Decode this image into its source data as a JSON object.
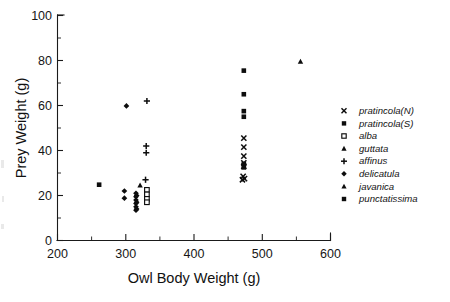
{
  "figure": {
    "background": "#ffffff",
    "ink_color": "#0d0d0d",
    "width": 450,
    "height": 302
  },
  "axes": {
    "x_title": "Owl Body Weight (g)",
    "y_title": "Prey Weight (g)",
    "x_ticks": [
      "200",
      "300",
      "400",
      "500",
      "600"
    ],
    "y_ticks": [
      "0",
      "20",
      "40",
      "60",
      "80",
      "100"
    ]
  },
  "legend": {
    "entries": [
      {
        "label": "pratincola(N)",
        "marker": "cross-x-icon"
      },
      {
        "label": "pratincola(S)",
        "marker": "filled-square-icon"
      },
      {
        "label": "alba",
        "marker": "open-square-icon"
      },
      {
        "label": "guttata",
        "marker": "filled-triangle-icon"
      },
      {
        "label": "affinus",
        "marker": "plus-icon"
      },
      {
        "label": "delicatula",
        "marker": "filled-diamond-icon"
      },
      {
        "label": "javanica",
        "marker": "filled-triangle-icon"
      },
      {
        "label": "punctatissima",
        "marker": "filled-square-icon"
      }
    ]
  },
  "chart_data": {
    "type": "scatter",
    "title": "",
    "xlabel": "Owl Body Weight (g)",
    "ylabel": "Prey Weight (g)",
    "xlim": [
      200,
      600
    ],
    "ylim": [
      0,
      100
    ],
    "xticks": [
      200,
      300,
      400,
      500,
      600
    ],
    "yticks": [
      0,
      20,
      40,
      60,
      80,
      100
    ],
    "x_minor_step": 50,
    "y_minor_step": 10,
    "grid": false,
    "legend_position": "right-outside",
    "series": [
      {
        "name": "pratincola(N)",
        "marker": "x",
        "filled": true,
        "points": [
          [
            473,
            45.5
          ],
          [
            473,
            41.5
          ],
          [
            473,
            37.5
          ],
          [
            473,
            34.5
          ],
          [
            473,
            33.0
          ],
          [
            472,
            28.5
          ],
          [
            474,
            27.5
          ],
          [
            471,
            27.0
          ]
        ]
      },
      {
        "name": "pratincola(S)",
        "marker": "square",
        "filled": true,
        "points": [
          [
            473,
            75.5
          ],
          [
            473,
            65.0
          ],
          [
            473,
            57.5
          ],
          [
            473,
            55.0
          ],
          [
            473,
            34.0
          ],
          [
            473,
            32.5
          ]
        ]
      },
      {
        "name": "alba",
        "marker": "square",
        "filled": false,
        "points": [
          [
            331,
            22.5
          ],
          [
            331,
            20.5
          ],
          [
            331,
            18.5
          ],
          [
            331,
            17.0
          ]
        ]
      },
      {
        "name": "guttata",
        "marker": "triangle",
        "filled": true,
        "points": [
          [
            321,
            24.5
          ]
        ]
      },
      {
        "name": "affinus",
        "marker": "plus",
        "filled": true,
        "points": [
          [
            331,
            62.0
          ],
          [
            330,
            42.0
          ],
          [
            330,
            39.0
          ],
          [
            329,
            27.0
          ]
        ]
      },
      {
        "name": "delicatula",
        "marker": "diamond",
        "filled": true,
        "points": [
          [
            301,
            59.8
          ],
          [
            298,
            22.0
          ],
          [
            298,
            18.8
          ],
          [
            315,
            21.0
          ],
          [
            315,
            19.5
          ],
          [
            315,
            18.0
          ],
          [
            315,
            16.5
          ],
          [
            315,
            15.0
          ],
          [
            315,
            13.5
          ],
          [
            316,
            20.0
          ],
          [
            316,
            17.0
          ],
          [
            316,
            14.0
          ]
        ]
      },
      {
        "name": "javanica",
        "marker": "triangle",
        "filled": true,
        "points": [
          [
            556,
            79.5
          ]
        ]
      },
      {
        "name": "punctatissima",
        "marker": "square",
        "filled": true,
        "points": [
          [
            261,
            24.8
          ]
        ]
      }
    ]
  }
}
